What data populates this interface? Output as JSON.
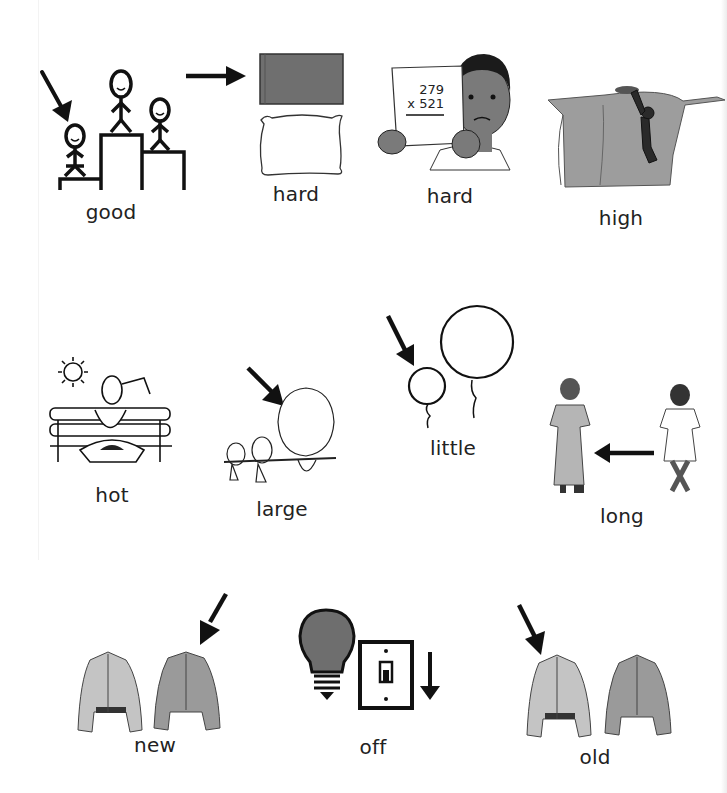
{
  "page": {
    "rows": [
      {
        "cards": [
          {
            "id": "good",
            "label": "good"
          },
          {
            "id": "hard-pillow",
            "label": "hard"
          },
          {
            "id": "hard-math",
            "label": "hard",
            "math": {
              "top": "279",
              "bottom": "x 521"
            }
          },
          {
            "id": "high",
            "label": "high"
          }
        ]
      },
      {
        "cards": [
          {
            "id": "hot",
            "label": "hot"
          },
          {
            "id": "large",
            "label": "large"
          },
          {
            "id": "little",
            "label": "little"
          },
          {
            "id": "long",
            "label": "long"
          }
        ]
      },
      {
        "cards": [
          {
            "id": "new",
            "label": "new"
          },
          {
            "id": "off",
            "label": "off"
          },
          {
            "id": "old",
            "label": "old"
          }
        ]
      }
    ]
  },
  "colors": {
    "ink": "#111111",
    "dark_fill": "#6e6e6e",
    "mid_fill": "#9a9a9a",
    "light_fill": "#c4c4c4",
    "skin": "#7a7a7a"
  },
  "icons": {
    "good": "podium-stick-figures-arrow-icon",
    "hard_pillow": "board-and-pillow-arrow-icon",
    "hard_math": "boy-holding-math-paper-icon",
    "high": "man-climbing-cliff-icon",
    "hot": "sweating-person-bench-sun-icon",
    "large": "birds-on-branch-arrow-icon",
    "little": "balloons-arrow-icon",
    "long": "girls-dresses-arrow-icon",
    "new": "jackets-arrow-new-icon",
    "off": "lightbulb-switch-down-icon",
    "old": "jackets-arrow-old-icon"
  }
}
